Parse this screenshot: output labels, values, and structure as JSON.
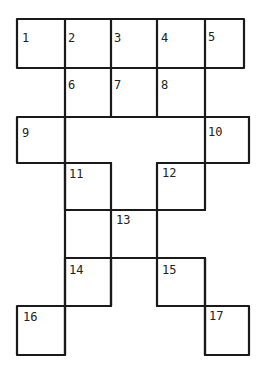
{
  "puzzle": {
    "type": "crossword-grid",
    "stroke_color": "#1a1a1a",
    "background": "#ffffff",
    "cells": [
      {
        "id": "c1",
        "number": "1",
        "x": 17,
        "y": 19,
        "w": 50,
        "h": 50
      },
      {
        "id": "c2",
        "number": "2",
        "x": 65,
        "y": 19,
        "w": 48,
        "h": 50
      },
      {
        "id": "c3",
        "number": "3",
        "x": 111,
        "y": 19,
        "w": 48,
        "h": 50
      },
      {
        "id": "c4",
        "number": "4",
        "x": 157,
        "y": 19,
        "w": 50,
        "h": 50
      },
      {
        "id": "c5",
        "number": "5",
        "x": 205,
        "y": 19,
        "w": 40,
        "h": 50
      },
      {
        "id": "c6",
        "number": "6",
        "x": 65,
        "y": 67,
        "w": 48,
        "h": 52
      },
      {
        "id": "c7",
        "number": "7",
        "x": 111,
        "y": 67,
        "w": 48,
        "h": 52
      },
      {
        "id": "c8",
        "number": "8",
        "x": 157,
        "y": 67,
        "w": 50,
        "h": 52
      },
      {
        "id": "c5b",
        "number": "",
        "x": 205,
        "y": 67,
        "w": 2,
        "h": 52
      },
      {
        "id": "c9",
        "number": "9",
        "x": 17,
        "y": 117,
        "w": 50,
        "h": 47
      },
      {
        "id": "cmid",
        "number": "",
        "x": 65,
        "y": 117,
        "w": 142,
        "h": 47
      },
      {
        "id": "c10",
        "number": "10",
        "x": 205,
        "y": 117,
        "w": 44,
        "h": 47
      },
      {
        "id": "c11",
        "number": "11",
        "x": 65,
        "y": 162,
        "w": 48,
        "h": 48
      },
      {
        "id": "c11b",
        "number": "",
        "x": 111,
        "y": 162,
        "w": 48,
        "h": 48
      },
      {
        "id": "c12",
        "number": "12",
        "x": 157,
        "y": 162,
        "w": 50,
        "h": 48
      },
      {
        "id": "c13",
        "number": "13",
        "x": 111,
        "y": 208,
        "w": 48,
        "h": 52
      },
      {
        "id": "c14",
        "number": "14",
        "x": 65,
        "y": 258,
        "w": 48,
        "h": 49
      },
      {
        "id": "c13b",
        "number": "",
        "x": 111,
        "y": 258,
        "w": 48,
        "h": 2
      },
      {
        "id": "c15",
        "number": "15",
        "x": 157,
        "y": 258,
        "w": 50,
        "h": 49
      },
      {
        "id": "c16",
        "number": "16",
        "x": 17,
        "y": 305,
        "w": 50,
        "h": 50
      },
      {
        "id": "c17",
        "number": "17",
        "x": 205,
        "y": 305,
        "w": 46,
        "h": 50
      }
    ]
  }
}
